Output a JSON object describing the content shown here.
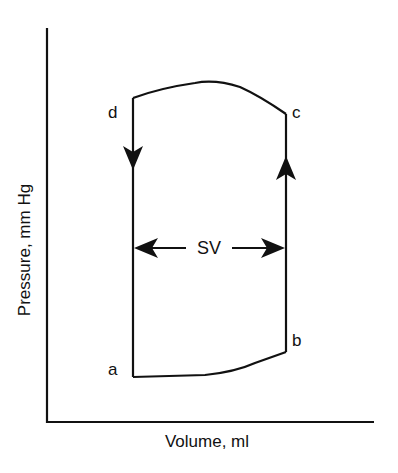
{
  "diagram": {
    "type": "pressure-volume loop",
    "axes": {
      "x_label": "Volume, ml",
      "y_label": "Pressure, mm Hg"
    },
    "points": {
      "a": "a",
      "b": "b",
      "c": "c",
      "d": "d"
    },
    "annotation": {
      "stroke_volume": "SV"
    },
    "colors": {
      "line": "#111111",
      "background": "#ffffff"
    }
  }
}
